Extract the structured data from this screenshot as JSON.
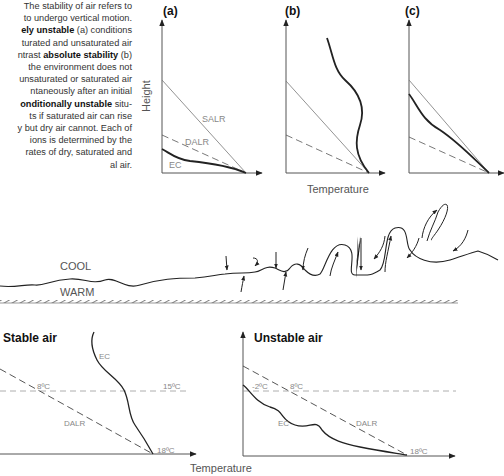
{
  "caption": {
    "lines": [
      {
        "pre": "The stability of air refers to",
        "bold": "",
        "post": ""
      },
      {
        "pre": "to undergo vertical motion.",
        "bold": "",
        "post": ""
      },
      {
        "pre": "",
        "bold": "ely unstable",
        "post": " (a) conditions"
      },
      {
        "pre": "turated and unsaturated air",
        "bold": "",
        "post": ""
      },
      {
        "pre": "ntrast ",
        "bold": "absolute stability",
        "post": " (b)"
      },
      {
        "pre": "the environment does not",
        "bold": "",
        "post": ""
      },
      {
        "pre": "unsaturated or saturated air",
        "bold": "",
        "post": ""
      },
      {
        "pre": "ntaneously after an initial",
        "bold": "",
        "post": ""
      },
      {
        "pre": "",
        "bold": "onditionally unstable",
        "post": " situ-"
      },
      {
        "pre": "ts if saturated air can rise",
        "bold": "",
        "post": ""
      },
      {
        "pre": "y but dry air cannot. Each of",
        "bold": "",
        "post": ""
      },
      {
        "pre": "ions is determined by the",
        "bold": "",
        "post": ""
      },
      {
        "pre": "rates of dry, saturated and",
        "bold": "",
        "post": ""
      },
      {
        "pre": "al air.",
        "bold": "",
        "post": ""
      }
    ]
  },
  "top_panels": {
    "y_axis_label": "Height",
    "x_axis_label": "Temperature",
    "panels": [
      {
        "id": "a",
        "label": "(a)",
        "line_labels": {
          "salr": "SALR",
          "dalr": "DALR",
          "ec": "EC"
        }
      },
      {
        "id": "b",
        "label": "(b)"
      },
      {
        "id": "c",
        "label": "(c)"
      }
    ]
  },
  "middle": {
    "cool_label": "COOL",
    "warm_label": "WARM"
  },
  "bottom_panels": {
    "x_axis_label": "Temperature",
    "stable": {
      "title": "Stable air",
      "ec_label": "EC",
      "dalr_label": "DALR",
      "temp_left": "8ºC",
      "temp_right": "15ºC",
      "temp_surface": "18ºC"
    },
    "unstable": {
      "title": "Unstable air",
      "ec_label": "EC",
      "dalr_label": "DALR",
      "temp_left": "-2ºC",
      "temp_right": "8ºC",
      "temp_surface": "18ºC"
    }
  },
  "colors": {
    "line": "#222222",
    "label": "#888888",
    "background": "#ffffff"
  }
}
